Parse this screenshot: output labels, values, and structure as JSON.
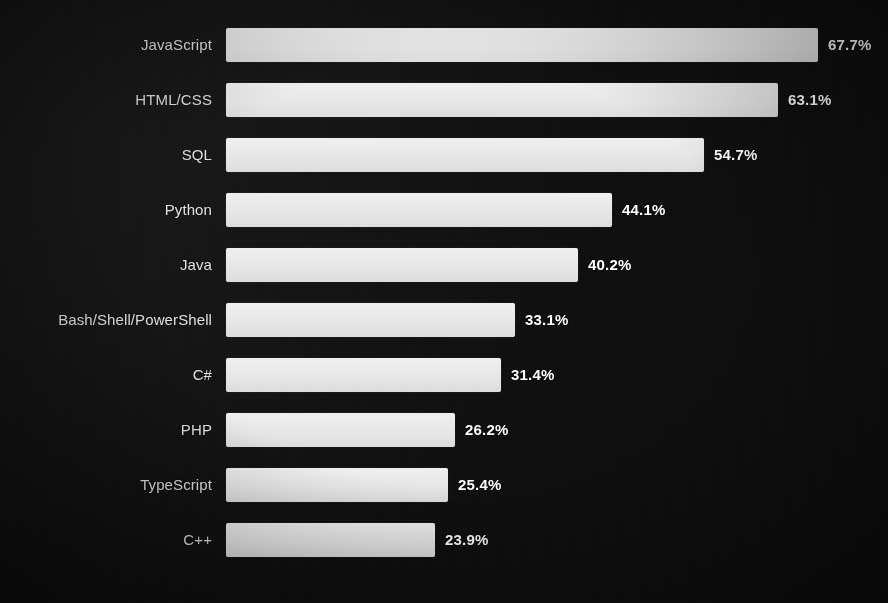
{
  "chart_data": {
    "type": "bar",
    "orientation": "horizontal",
    "title": "",
    "subtitle": "",
    "xlabel": "",
    "ylabel": "",
    "grid": false,
    "legend": "none",
    "xlim": [
      0,
      67.7
    ],
    "value_suffix": "%",
    "categories": [
      "JavaScript",
      "HTML/CSS",
      "SQL",
      "Python",
      "Java",
      "Bash/Shell/PowerShell",
      "C#",
      "PHP",
      "TypeScript",
      "C++"
    ],
    "values": [
      67.7,
      63.1,
      54.7,
      44.1,
      40.2,
      33.1,
      31.4,
      26.2,
      25.4,
      23.9
    ],
    "value_labels": [
      "67.7%",
      "63.1%",
      "54.7%",
      "44.1%",
      "40.2%",
      "33.1%",
      "31.4%",
      "26.2%",
      "25.4%",
      "23.9%"
    ],
    "bars": [
      {
        "category": "JavaScript",
        "value": 67.7,
        "label": "67.7%"
      },
      {
        "category": "HTML/CSS",
        "value": 63.1,
        "label": "63.1%"
      },
      {
        "category": "SQL",
        "value": 54.7,
        "label": "54.7%"
      },
      {
        "category": "Python",
        "value": 44.1,
        "label": "44.1%"
      },
      {
        "category": "Java",
        "value": 40.2,
        "label": "40.2%"
      },
      {
        "category": "Bash/Shell/PowerShell",
        "value": 33.1,
        "label": "33.1%"
      },
      {
        "category": "C#",
        "value": 31.4,
        "label": "31.4%"
      },
      {
        "category": "PHP",
        "value": 26.2,
        "label": "26.2%"
      },
      {
        "category": "TypeScript",
        "value": 25.4,
        "label": "25.4%"
      },
      {
        "category": "C++",
        "value": 23.9,
        "label": "23.9%"
      }
    ],
    "colors": {
      "background": "#111111",
      "bar_fill": "#e7e7e7",
      "category_label": "#e3e3e3",
      "value_label": "#ffffff"
    }
  }
}
